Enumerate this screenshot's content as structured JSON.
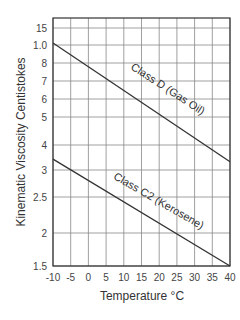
{
  "chart_data": {
    "type": "line",
    "title": "",
    "xlabel": "Temperature °C",
    "ylabel": "Kinematic Viscosity Centistokes",
    "x_ticks": [
      "-10",
      "-5",
      "0",
      "5",
      "10",
      "15",
      "20",
      "25",
      "30",
      "35",
      "40"
    ],
    "y_ticks": [
      "15",
      "1.0",
      "8",
      "7",
      "6",
      "5",
      "4",
      "3",
      "2.5",
      "2",
      "1.5"
    ],
    "xlim": [
      -10,
      40
    ],
    "ylim": [
      1.5,
      15
    ],
    "yscale": "log-like (non-uniform)",
    "grid": true,
    "legend": "inline labels on lines",
    "series": [
      {
        "name": "Class D (Gas Oil)",
        "x": [
          -10,
          40
        ],
        "values": [
          10.5,
          3.3
        ]
      },
      {
        "name": "Class C2 (Kerosene)",
        "x": [
          -10,
          40
        ],
        "values": [
          3.4,
          1.5
        ]
      }
    ]
  }
}
